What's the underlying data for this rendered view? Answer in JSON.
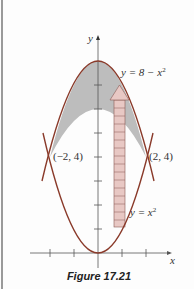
{
  "figure": {
    "caption": "Figure 17.21",
    "axis_x_label": "x",
    "axis_y_label": "y",
    "curve_upper_label_prefix": "y = 8 − x",
    "curve_upper_label_exp": "2",
    "curve_lower_label_prefix": "y = x",
    "curve_lower_label_exp": "2",
    "point_left": "(−2, 4)",
    "point_right": "(2, 4)",
    "colors": {
      "curve": "#8a3a2a",
      "fill": "#bdbdbd",
      "strip": "#e8c8c4",
      "axis": "#555555",
      "border": "#9a9a9a"
    }
  }
}
